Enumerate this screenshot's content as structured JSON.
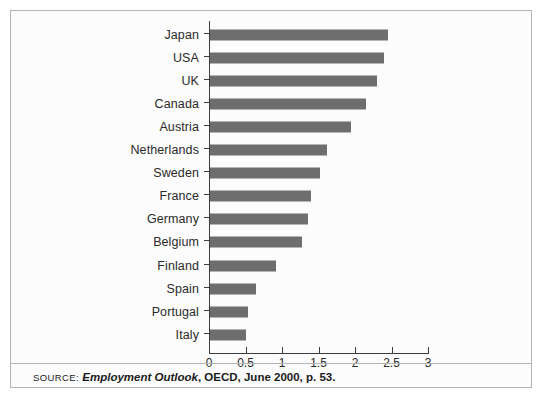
{
  "chart_data": {
    "type": "bar",
    "orientation": "horizontal",
    "title": "",
    "subtitle": "",
    "xlabel": "",
    "ylabel": "",
    "xlim": [
      0,
      3
    ],
    "xticks": [
      "0",
      "0.5",
      "1",
      "1.5",
      "2",
      "2.5",
      "3"
    ],
    "xtick_values": [
      0,
      0.5,
      1,
      1.5,
      2,
      2.5,
      3
    ],
    "grid": false,
    "legend": null,
    "bar_color": "#6e6e6e",
    "categories": [
      "Japan",
      "USA",
      "UK",
      "Canada",
      "Austria",
      "Netherlands",
      "Sweden",
      "France",
      "Germany",
      "Belgium",
      "Finland",
      "Spain",
      "Portugal",
      "Italy"
    ],
    "values": [
      2.45,
      2.4,
      2.3,
      2.15,
      1.95,
      1.62,
      1.52,
      1.4,
      1.35,
      1.28,
      0.92,
      0.65,
      0.53,
      0.5
    ]
  },
  "source": {
    "keyword": "SOURCE:",
    "title": "Employment Outlook",
    "rest": ", OECD, June 2000, p. 53."
  },
  "colors": {
    "bar": "#6e6e6e",
    "axis": "#3c3c3c",
    "frame": "#b4b4b4",
    "text": "#1a1a1a",
    "background": "#fcfcfc"
  }
}
